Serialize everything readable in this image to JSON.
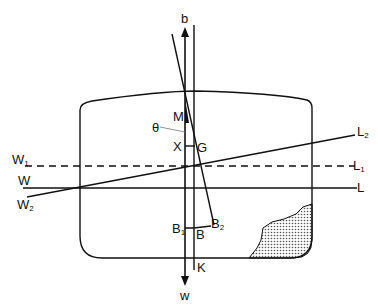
{
  "diagram": {
    "type": "ship-stability",
    "colors": {
      "line": "#111111",
      "background": "#ffffff",
      "cargo_fill": "#8a8a8a"
    },
    "labels": {
      "b": "b",
      "w": "w",
      "M": "M",
      "theta": "θ",
      "X": "X",
      "G": "G",
      "W1": {
        "main": "W",
        "sub": "1"
      },
      "L1": {
        "main": "L",
        "sub": "1"
      },
      "W": "W",
      "L": "L",
      "W2": {
        "main": "W",
        "sub": "2"
      },
      "L2": {
        "main": "L",
        "sub": "2"
      },
      "B1": {
        "main": "B",
        "sub": "1"
      },
      "B": "B",
      "B2": {
        "main": "B",
        "sub": "2"
      },
      "K": "K"
    },
    "waterlines": [
      {
        "name": "W1-L1",
        "style": "dashed"
      },
      {
        "name": "W-L",
        "style": "solid"
      },
      {
        "name": "W2-L2",
        "style": "solid, inclined"
      }
    ],
    "forces": [
      {
        "name": "buoyancy",
        "label": "b",
        "direction": "up"
      },
      {
        "name": "weight",
        "label": "w",
        "direction": "down"
      }
    ],
    "shifted_cargo": {
      "position": "bottom-right of hold",
      "fill": "stippled"
    }
  }
}
